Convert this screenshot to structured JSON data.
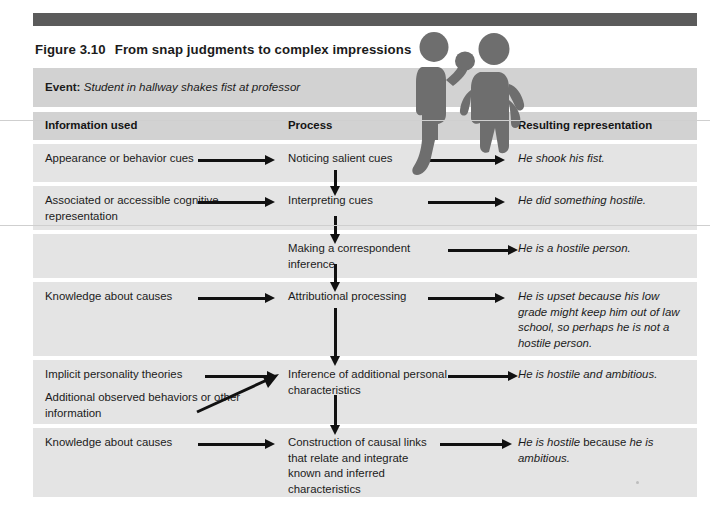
{
  "figure": {
    "number": "Figure 3.10",
    "title": "From snap judgments to complex impressions",
    "event_label": "Event:",
    "event_text": "Student in hallway shakes fist at professor"
  },
  "columns": [
    {
      "label": "Information used"
    },
    {
      "label": "Process"
    },
    {
      "label": "Resulting representation"
    }
  ],
  "rows": [
    {
      "information": "Appearance or behavior cues",
      "process": "Noticing salient cues",
      "representation": "He shook his fist."
    },
    {
      "information": "Associated or accessible cognitive representation",
      "process": "Interpreting cues",
      "representation": "He did something hostile."
    },
    {
      "information": "",
      "process": "Making a correspondent inference",
      "representation": "He is a hostile person."
    },
    {
      "information": "Knowledge about causes",
      "process": "Attributional processing",
      "representation": "He is upset because his low grade might keep him out of law school, so perhaps he is not a hostile person."
    },
    {
      "information": "Implicit personality theories",
      "information_secondary": "Additional observed behaviors or other information",
      "process": "Inference of additional personal characteristics",
      "representation": "He is hostile and ambitious."
    },
    {
      "information": "Knowledge about causes",
      "process": "Construction of causal links that relate and integrate known and inferred characteristics",
      "representation_italic_1": "He is hostile",
      "representation_roman": " because ",
      "representation_italic_2": "he is ambitious."
    }
  ],
  "illustration": {
    "name": "two-people-confrontation-silhouette",
    "figures": [
      "student-raising-fist",
      "professor-hand-on-hip"
    ]
  },
  "colors": {
    "top_bar": "#5b5b5b",
    "band_header": "#d2d2d2",
    "band_row": "#e4e4e4",
    "silhouette": "#6e6e6e",
    "arrow": "#111111",
    "text": "#1b1b1b"
  }
}
